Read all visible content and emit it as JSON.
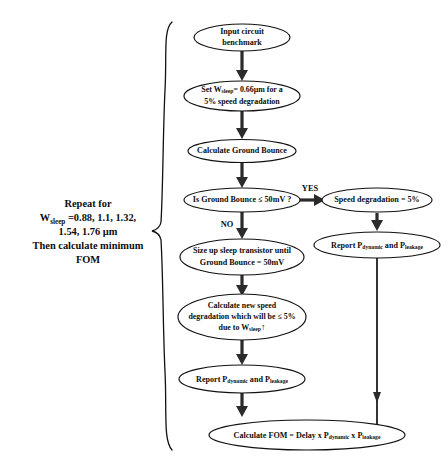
{
  "diagram": {
    "caption": {
      "line1": "Repeat for",
      "line2_prefix": "W",
      "line2_sub": "sleep",
      "line2_suffix": " =0.88, 1.1, 1.32,",
      "line3": "1.54, 1.76 µm",
      "line4": "Then calculate minimum",
      "line5": "FOM"
    },
    "nodes": {
      "input": {
        "line1": "Input circuit",
        "line2": "benchmark"
      },
      "set_w": {
        "l1_a": "Set W",
        "l1_sub": "sleep",
        "l1_b": "= 0.66µm for a",
        "l2": "5% speed degradation"
      },
      "calc_gb": {
        "line1": "Calculate Ground Bounce"
      },
      "decision": {
        "line1": "Is Ground Bounce ≤ 50mV ?"
      },
      "speed_deg": {
        "line1": "Speed degradation = 5%"
      },
      "report_right": {
        "a": "Report P",
        "sub1": "dynamic",
        "b": " and P",
        "sub2": "leakage"
      },
      "size_up": {
        "line1": "Size up sleep transistor until",
        "line2": "Ground Bounce = 50mV"
      },
      "calc_new": {
        "line1": "Calculate new speed",
        "line2": "degradation which will be ≤ 5%",
        "l3_a": "due to W",
        "l3_sub": "sleep",
        "l3_arrow": "↑"
      },
      "report_mid": {
        "a": "Report P",
        "sub1": "dynamic",
        "b": " and P",
        "sub2": "leakage"
      },
      "fom": {
        "a": "Calculate FOM = Delay ",
        "x1": "x",
        "b": " P",
        "sub1": "dynamic",
        "x2": " x",
        "c": " P",
        "sub2": "leakage"
      }
    },
    "edge_labels": {
      "yes": "YES",
      "no": "NO"
    },
    "colors": {
      "stroke": "#111111",
      "arrow": "#2b2b2b",
      "background": "#ffffff",
      "text": "#0d0d0d"
    }
  }
}
